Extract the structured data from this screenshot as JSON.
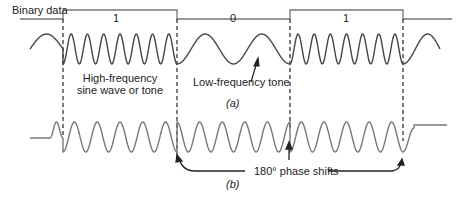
{
  "figure": {
    "binary_data_label": "Binary data",
    "bits": [
      "1",
      "0",
      "1"
    ],
    "annotation_high": [
      "High-frequency",
      "sine wave or tone"
    ],
    "annotation_low": "Low-frequency tone",
    "caption_a": "(a)",
    "caption_b": "(b)",
    "annotation_phase": "180° phase shifts",
    "colors": {
      "signal": "#555555",
      "line": "#777777",
      "text": "#222222"
    }
  }
}
